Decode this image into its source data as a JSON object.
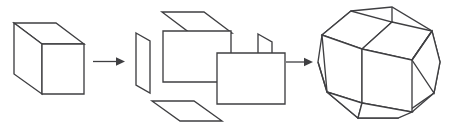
{
  "figure": {
    "title": "Cube to rhombicuboctahedron transformation sequence",
    "background_color": "#ffffff",
    "stroke_color": "#3f3f42",
    "fill_color": "#ffffff",
    "width": 457,
    "height": 129,
    "panel_count": 3,
    "arrow_count": 2
  },
  "panels": [
    {
      "id": "cube",
      "label": "cube",
      "description": "Wireframe cube drawn in oblique projection with visible top face, left face and front face",
      "face_labels": [
        "top-face",
        "left-face",
        "front-face"
      ],
      "face_count": 3
    },
    {
      "id": "exploded-cube",
      "label": "exploded cube",
      "description": "Six square faces of a cube separated outward along their normals",
      "face_labels": [
        "back-face",
        "front-face",
        "top-face",
        "bottom-face",
        "left-face",
        "right-face"
      ],
      "face_count": 6
    },
    {
      "id": "rhombicuboctahedron",
      "label": "rhombicuboctahedron",
      "description": "Expanded polyhedron formed by the separated cube faces plus new square and triangular faces filling the gaps",
      "face_labels": [
        "front-square",
        "top-square",
        "upper-left-square",
        "left-square",
        "right-square",
        "bottom-square",
        "corner-triangles"
      ],
      "face_count": 9
    }
  ],
  "arrows": [
    {
      "id": "arrow-1",
      "label": "transforms into",
      "direction": "right"
    },
    {
      "id": "arrow-2",
      "label": "transforms into",
      "direction": "right"
    }
  ]
}
